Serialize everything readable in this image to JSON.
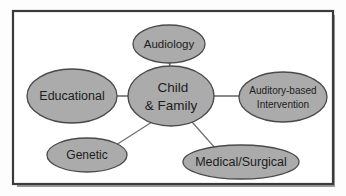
{
  "figure": {
    "kind": "concept-map",
    "background_color": "#fdfdfd",
    "frame": {
      "border_color": "#3a3a3a",
      "shadow_color": "#9a9a9a",
      "fill_color": "#ffffff"
    },
    "style": {
      "node_fill": "#ababab",
      "node_stroke": "#4a4a4a",
      "connector_color": "#6d6d6d",
      "text_color": "#1c1c1c"
    }
  },
  "nodes": {
    "center": {
      "id": "child-and-family",
      "line1": "Child",
      "line2": "& Family",
      "cx": 171,
      "cy": 96,
      "rx": 43,
      "ry": 30,
      "font_size": 13.5
    },
    "audiology": {
      "id": "audiology",
      "line1": "Audiology",
      "cx": 169,
      "cy": 44,
      "rx": 36,
      "ry": 19,
      "font_size": 11.5
    },
    "educational": {
      "id": "educational",
      "line1": "Educational",
      "cx": 72,
      "cy": 96,
      "rx": 45,
      "ry": 27,
      "font_size": 12.5
    },
    "auditory_based_intervention": {
      "id": "auditory-based-intervention",
      "line1": "Auditory-based",
      "line2": "Intervention",
      "cx": 283,
      "cy": 97,
      "rx": 44,
      "ry": 25,
      "font_size": 10
    },
    "genetic": {
      "id": "genetic",
      "line1": "Genetic",
      "cx": 87,
      "cy": 155,
      "rx": 40,
      "ry": 17,
      "font_size": 12
    },
    "medical_surgical": {
      "id": "medical-surgical",
      "line1": "Medical/Surgical",
      "cx": 241,
      "cy": 162,
      "rx": 58,
      "ry": 17,
      "font_size": 12.5
    }
  },
  "connectors": [
    {
      "id": "center-to-audiology",
      "from": "child-and-family",
      "to": "audiology",
      "x1": 170,
      "y1": 66,
      "x2": 169,
      "y2": 60
    },
    {
      "id": "center-to-educational",
      "from": "child-and-family",
      "to": "educational",
      "x1": 128,
      "y1": 96,
      "x2": 117,
      "y2": 96
    },
    {
      "id": "center-to-auditory",
      "from": "child-and-family",
      "to": "auditory-based-intervention",
      "x1": 214,
      "y1": 96,
      "x2": 239,
      "y2": 96
    },
    {
      "id": "center-to-genetic",
      "from": "child-and-family",
      "to": "genetic",
      "x1": 151,
      "y1": 122,
      "x2": 115,
      "y2": 145
    },
    {
      "id": "center-to-medical",
      "from": "child-and-family",
      "to": "medical-surgical",
      "x1": 192,
      "y1": 122,
      "x2": 216,
      "y2": 149
    }
  ]
}
